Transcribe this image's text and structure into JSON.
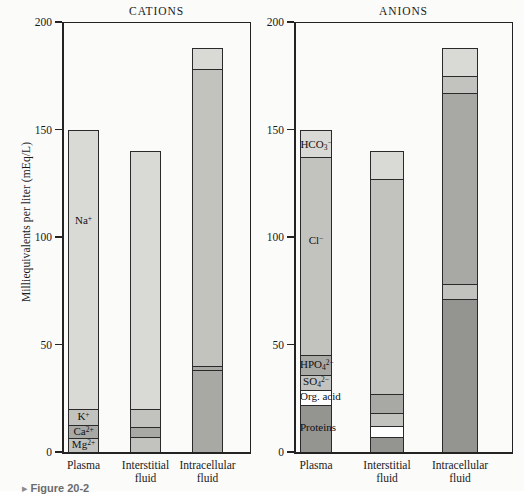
{
  "figure": {
    "caption": "Figure 20-2",
    "caption_marker": "▸",
    "y_axis_title": "Milliequivalents per liter (mEq/L)"
  },
  "axis": {
    "ticks": [
      "0",
      "50",
      "100",
      "150",
      "200"
    ],
    "tick_values": [
      0,
      50,
      100,
      150,
      200
    ],
    "min": 0,
    "max": 200
  },
  "panels": [
    {
      "title": "CATIONS"
    },
    {
      "title": "ANIONS"
    }
  ],
  "categories": [
    {
      "line1": "Plasma",
      "line2": ""
    },
    {
      "line1": "Interstitial",
      "line2": "fluid"
    },
    {
      "line1": "Intracellular",
      "line2": "fluid"
    }
  ],
  "colors": {
    "light_gray": "#d9d9d6",
    "mid_gray": "#c2c2bf",
    "dark_gray": "#a8a8a5",
    "darker_gray": "#949491",
    "white": "#ffffff",
    "outline": "#2a2a2a",
    "text": "#1a1a1a"
  },
  "chart_data": {
    "type": "bar",
    "subtitle": "",
    "xlabel": "",
    "ylabel": "Milliequivalents per liter (mEq/L)",
    "ylim": [
      0,
      200
    ],
    "yticks": [
      0,
      50,
      100,
      150,
      200
    ],
    "grid": false,
    "legend": "none",
    "stacked": true,
    "categories": [
      "Plasma",
      "Interstitial fluid",
      "Intracellular fluid"
    ],
    "panels": [
      {
        "name": "CATIONS",
        "totals": [
          150,
          140,
          188
        ],
        "bars": [
          {
            "category": "Plasma",
            "total": 150,
            "segments": [
              {
                "label": "Na+",
                "label_html": "Na<sup>+</sup>",
                "value": 130,
                "from": 20,
                "to": 150,
                "fill": "light_gray",
                "label_shown": true
              },
              {
                "label": "K+",
                "label_html": "K<sup>+</sup>",
                "value": 7.5,
                "from": 12.5,
                "to": 20,
                "fill": "mid_gray",
                "label_shown": true
              },
              {
                "label": "Ca2+",
                "label_html": "Ca<sup>2+</sup>",
                "value": 6,
                "from": 6.5,
                "to": 12.5,
                "fill": "dark_gray",
                "label_shown": true
              },
              {
                "label": "Mg2+",
                "label_html": "Mg<sup>2+</sup>",
                "value": 6.5,
                "from": 0,
                "to": 6.5,
                "fill": "mid_gray",
                "label_shown": true
              }
            ]
          },
          {
            "category": "Interstitial fluid",
            "total": 140,
            "segments": [
              {
                "label": "Na+",
                "label_html": "Na<sup>+</sup>",
                "value": 120,
                "from": 20,
                "to": 140,
                "fill": "light_gray",
                "label_shown": false
              },
              {
                "label": "K+",
                "label_html": "K<sup>+</sup>",
                "value": 8.5,
                "from": 11.5,
                "to": 20,
                "fill": "mid_gray",
                "label_shown": false
              },
              {
                "label": "Ca2+",
                "label_html": "Ca<sup>2+</sup>",
                "value": 4.5,
                "from": 7,
                "to": 11.5,
                "fill": "dark_gray",
                "label_shown": false
              },
              {
                "label": "Mg2+",
                "label_html": "Mg<sup>2+</sup>",
                "value": 7,
                "from": 0,
                "to": 7,
                "fill": "mid_gray",
                "label_shown": false
              }
            ]
          },
          {
            "category": "Intracellular fluid",
            "total": 188,
            "segments": [
              {
                "label": "K+",
                "label_html": "K<sup>+</sup>",
                "value": 10,
                "from": 178,
                "to": 188,
                "fill": "light_gray",
                "label_shown": false
              },
              {
                "label": "Mg2+",
                "label_html": "Mg<sup>2+</sup>",
                "value": 138,
                "from": 40,
                "to": 178,
                "fill": "mid_gray",
                "label_shown": false
              },
              {
                "label": "Ca2+",
                "label_html": "Ca<sup>2+</sup>",
                "value": 2,
                "from": 38,
                "to": 40,
                "fill": "dark_gray",
                "label_shown": false
              },
              {
                "label": "Na+",
                "label_html": "Na<sup>+</sup>",
                "value": 38,
                "from": 0,
                "to": 38,
                "fill": "dark_gray",
                "label_shown": false
              }
            ]
          }
        ]
      },
      {
        "name": "ANIONS",
        "totals": [
          150,
          140,
          188
        ],
        "bars": [
          {
            "category": "Plasma",
            "total": 150,
            "segments": [
              {
                "label": "HCO3-",
                "label_html": "HCO<sub>3</sub><sup>−</sup>",
                "value": 13,
                "from": 137,
                "to": 150,
                "fill": "light_gray",
                "label_shown": true
              },
              {
                "label": "Cl-",
                "label_html": "Cl<sup>−</sup>",
                "value": 92,
                "from": 45,
                "to": 137,
                "fill": "mid_gray",
                "label_shown": true
              },
              {
                "label": "HPO4 2-",
                "label_html": "HPO<sub>4</sub><sup>2−</sup>",
                "value": 9,
                "from": 36,
                "to": 45,
                "fill": "dark_gray",
                "label_shown": true
              },
              {
                "label": "SO4 2-",
                "label_html": "SO<sub>4</sub><sup>2−</sup>",
                "value": 7,
                "from": 29,
                "to": 36,
                "fill": "mid_gray",
                "label_shown": true
              },
              {
                "label": "Org. acid",
                "label_html": "Org. acid",
                "value": 7,
                "from": 22,
                "to": 29,
                "fill": "white",
                "label_shown": true
              },
              {
                "label": "Proteins",
                "label_html": "Proteins",
                "value": 22,
                "from": 0,
                "to": 22,
                "fill": "darker_gray",
                "label_shown": true
              }
            ]
          },
          {
            "category": "Interstitial fluid",
            "total": 140,
            "segments": [
              {
                "label": "HCO3-",
                "label_html": "HCO<sub>3</sub><sup>−</sup>",
                "value": 13,
                "from": 127,
                "to": 140,
                "fill": "light_gray",
                "label_shown": false
              },
              {
                "label": "Cl-",
                "label_html": "Cl<sup>−</sup>",
                "value": 100,
                "from": 27,
                "to": 127,
                "fill": "mid_gray",
                "label_shown": false
              },
              {
                "label": "HPO4 2-",
                "label_html": "HPO<sub>4</sub><sup>2−</sup>",
                "value": 9,
                "from": 18,
                "to": 27,
                "fill": "dark_gray",
                "label_shown": false
              },
              {
                "label": "SO4 2-",
                "label_html": "SO<sub>4</sub><sup>2−</sup>",
                "value": 6,
                "from": 12,
                "to": 18,
                "fill": "mid_gray",
                "label_shown": false
              },
              {
                "label": "Org. acid",
                "label_html": "Org. acid",
                "value": 5,
                "from": 7,
                "to": 12,
                "fill": "white",
                "label_shown": false
              },
              {
                "label": "Proteins",
                "label_html": "Proteins",
                "value": 7,
                "from": 0,
                "to": 7,
                "fill": "darker_gray",
                "label_shown": false
              }
            ]
          },
          {
            "category": "Intracellular fluid",
            "total": 188,
            "segments": [
              {
                "label": "HCO3-",
                "label_html": "HCO<sub>3</sub><sup>−</sup>",
                "value": 13,
                "from": 175,
                "to": 188,
                "fill": "light_gray",
                "label_shown": false
              },
              {
                "label": "Cl-",
                "label_html": "Cl<sup>−</sup>",
                "value": 8,
                "from": 167,
                "to": 175,
                "fill": "mid_gray",
                "label_shown": false
              },
              {
                "label": "HPO4 2-",
                "label_html": "HPO<sub>4</sub><sup>2−</sup>",
                "value": 89,
                "from": 78,
                "to": 167,
                "fill": "dark_gray",
                "label_shown": false
              },
              {
                "label": "SO4 2-",
                "label_html": "SO<sub>4</sub><sup>2−</sup>",
                "value": 7,
                "from": 71,
                "to": 78,
                "fill": "mid_gray",
                "label_shown": false
              },
              {
                "label": "Proteins",
                "label_html": "Proteins",
                "value": 71,
                "from": 0,
                "to": 71,
                "fill": "darker_gray",
                "label_shown": false
              }
            ]
          }
        ]
      }
    ]
  }
}
